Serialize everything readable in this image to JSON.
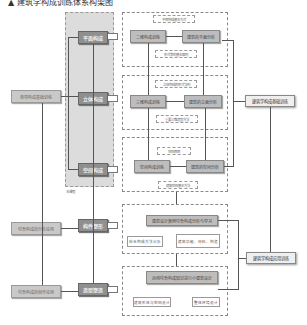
{
  "title": "▲ 建筑学构成训练体系构架图",
  "core_column": {
    "items": [
      {
        "label": "平面构成"
      },
      {
        "label": "立体构成"
      },
      {
        "label": "空间构成"
      },
      {
        "label": "构件塑形"
      },
      {
        "label": "造型塑造"
      }
    ],
    "note": "本课程"
  },
  "left_column": {
    "items": [
      {
        "label": "单项构成基础训练"
      },
      {
        "label": "综合构成的分析应用"
      },
      {
        "label": "综合构成的创作应用"
      }
    ]
  },
  "modules": [
    {
      "main_left": "二维构成训练",
      "main_right": "建筑的平面分析",
      "top_note": "平面构成基本方式",
      "bottom_note": "形式美的基本原则"
    },
    {
      "main_left": "三维构成训练",
      "main_right": "建筑的立面分析",
      "top_note": "立体构成的形式法则",
      "bottom_note": "重要三维造型方法"
    },
    {
      "main_left": "空间构成训练",
      "main_right": "建筑的空间分析",
      "top_note": "空间界面",
      "bottom_note": "建筑空间基本方法"
    }
  ],
  "analysis_module": {
    "main": "建筑设计案例综合构成分析与学习",
    "left": "综合构成方法分析",
    "right": "建筑功能、材料、构造"
  },
  "design_module": {
    "main": "运用综合构成知识进行小建筑设计",
    "left": "建筑形体与空间设计",
    "right": "整体环境设计"
  },
  "outputs": [
    {
      "label": "建筑学构成基础训练"
    },
    {
      "label": "建筑学构成应用训练"
    }
  ]
}
